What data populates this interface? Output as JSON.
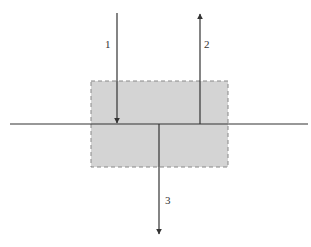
{
  "diagram": {
    "type": "arrow-interface-diagram",
    "colors": {
      "line": "#333333",
      "region_fill": "#d4d4d4",
      "region_border": "#888888",
      "background": "#ffffff"
    },
    "region": {
      "style": "dashed-rectangle",
      "description": "shaded medium region"
    },
    "interface": {
      "description": "horizontal boundary line"
    },
    "arrows": [
      {
        "id": "1",
        "label": "1",
        "direction": "down",
        "description": "incident arrow ending at boundary"
      },
      {
        "id": "2",
        "label": "2",
        "direction": "up",
        "description": "arrow leaving boundary upward"
      },
      {
        "id": "3",
        "label": "3",
        "direction": "down",
        "description": "arrow leaving boundary downward"
      }
    ]
  }
}
